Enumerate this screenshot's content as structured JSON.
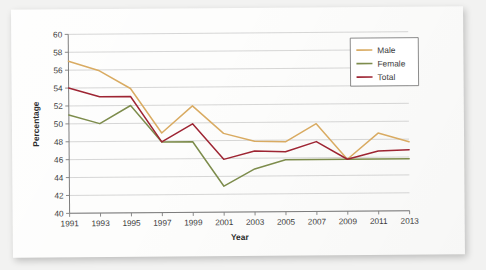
{
  "chart_data": {
    "type": "line",
    "title": "",
    "xlabel": "Year",
    "ylabel": "Percentage",
    "categories": [
      "1991",
      "1993",
      "1995",
      "1997",
      "1999",
      "2001",
      "2003",
      "2005",
      "2007",
      "2009",
      "2011",
      "2013"
    ],
    "x": [
      1991,
      1993,
      1995,
      1997,
      1999,
      2001,
      2003,
      2005,
      2007,
      2009,
      2011,
      2013
    ],
    "xlim": [
      1991,
      2013
    ],
    "ylim": [
      40,
      60
    ],
    "ytick_labels": [
      "40",
      "42",
      "44",
      "46",
      "48",
      "50",
      "52",
      "54",
      "56",
      "58",
      "60"
    ],
    "ytick_values": [
      40,
      42,
      44,
      46,
      48,
      50,
      52,
      54,
      56,
      58,
      60
    ],
    "grid": true,
    "legend_position": "top-right",
    "series": [
      {
        "name": "Male",
        "color": "#d9ab62",
        "values": [
          57.0,
          55.9,
          53.9,
          48.9,
          51.9,
          48.8,
          47.9,
          47.8,
          49.8,
          45.8,
          48.7,
          47.7
        ]
      },
      {
        "name": "Female",
        "color": "#7d8c4c",
        "values": [
          51.0,
          50.0,
          52.0,
          47.9,
          47.9,
          42.9,
          44.8,
          45.8,
          45.8,
          45.8,
          45.8,
          45.8
        ]
      },
      {
        "name": "Total",
        "color": "#9e2533",
        "values": [
          54.0,
          53.0,
          53.0,
          47.9,
          49.9,
          45.9,
          46.8,
          46.7,
          47.8,
          45.8,
          46.7,
          46.8
        ]
      }
    ]
  },
  "legend": {
    "items": [
      {
        "label": "Male"
      },
      {
        "label": "Female"
      },
      {
        "label": "Total"
      }
    ]
  },
  "axes": {
    "x_title": "Year",
    "y_title": "Percentage"
  }
}
